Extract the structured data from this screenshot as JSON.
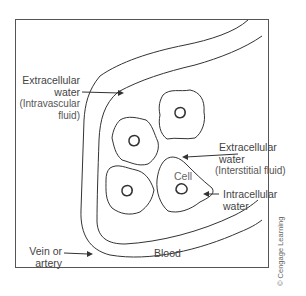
{
  "diagram": {
    "labels": {
      "extracellular_intravascular": {
        "line1": "Extracellular",
        "line2": "water",
        "line3": "(Intravascular",
        "line4": "fluid)"
      },
      "extracellular_interstitial": {
        "line1": "Extracellular",
        "line2": "water",
        "line3": "(Interstitial fluid)"
      },
      "cell": "Cell",
      "intracellular": {
        "line1": "Intracellular",
        "line2": "water"
      },
      "vessel": {
        "line1": "Vein or",
        "line2": "artery"
      },
      "blood": "Blood"
    },
    "copyright": "© Cengage Learning",
    "colors": {
      "line": "#333333",
      "text": "#444444",
      "background": "#ffffff"
    }
  }
}
